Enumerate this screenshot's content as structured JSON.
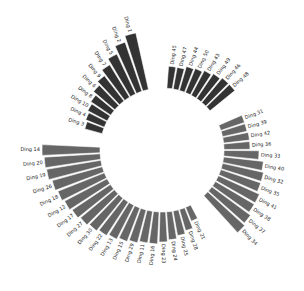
{
  "chart_data": {
    "type": "bar",
    "subtype": "circular-barplot",
    "title": "",
    "xlabel": "",
    "ylabel": "",
    "grid": false,
    "legend": null,
    "center": [
      162,
      150
    ],
    "inner_radius": 62,
    "groups": [
      {
        "name": "A",
        "color": "#333333",
        "start_angle": 198,
        "step": 6.3,
        "categories": [
          "Ding 3",
          "Ding 4",
          "Ding 10",
          "Ding 8",
          "Ding 6",
          "Ding 9",
          "Ding 7",
          "Ding 5",
          "Ding 2",
          "Ding 1"
        ],
        "values": [
          18,
          20,
          22,
          24,
          28,
          32,
          38,
          44,
          52,
          58
        ]
      },
      {
        "name": "B",
        "color": "#333333",
        "start_angle": -83,
        "step": 5.9,
        "categories": [
          "Ding 45",
          "Ding 47",
          "Ding 44",
          "Ding 50",
          "Ding 43",
          "Ding 49",
          "Ding 46",
          "Ding 48"
        ],
        "values": [
          22,
          22,
          25,
          26,
          28,
          30,
          32,
          32
        ]
      },
      {
        "name": "C",
        "color": "#666666",
        "start_angle": -21,
        "step": 6.0,
        "categories": [
          "Ding 31",
          "Ding 39",
          "Ding 42",
          "Ding 36",
          "Ding 33",
          "Ding 40",
          "Ding 32",
          "Ding 35",
          "Ding 41",
          "Ding 38",
          "Ding 37",
          "Ding 34"
        ],
        "values": [
          25,
          25,
          26,
          26,
          35,
          40,
          42,
          42,
          45,
          45,
          48,
          50
        ]
      },
      {
        "name": "D",
        "color": "#666666",
        "start_angle": 180,
        "step": -6.05,
        "categories": [
          "Ding 14",
          "Ding 20",
          "Ding 19",
          "Ding 26",
          "Ding 18",
          "Ding 12",
          "Ding 17",
          "Ding 27",
          "Ding 30",
          "Ding 22",
          "Ding 13",
          "Ding 15",
          "Ding 29",
          "Ding 11",
          "Ding 16",
          "Ding 23",
          "Ding 24",
          "Ding 25",
          "Ding 28",
          "Ding 21"
        ],
        "values": [
          58,
          56,
          55,
          52,
          50,
          48,
          46,
          44,
          42,
          40,
          38,
          36,
          34,
          32,
          32,
          30,
          28,
          25,
          22,
          15
        ]
      }
    ]
  }
}
